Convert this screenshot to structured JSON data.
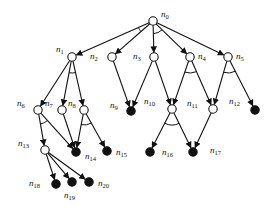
{
  "diagram": {
    "type": "and-or-tree",
    "colors": {
      "stroke": "#111111",
      "background": "#ffffff",
      "terminal_fill": "#111111"
    },
    "nodes": [
      {
        "id": "n0",
        "label": "n",
        "sub": "0",
        "x": 153,
        "y": 21,
        "filled": false,
        "lx": 161,
        "ly": 17,
        "lanchor": "start"
      },
      {
        "id": "n1",
        "label": "n",
        "sub": "1",
        "x": 72,
        "y": 57,
        "filled": false,
        "lx": 56,
        "ly": 52,
        "lanchor": "end"
      },
      {
        "id": "n2",
        "label": "n",
        "sub": "2",
        "x": 112,
        "y": 57,
        "filled": false,
        "lx": 90,
        "ly": 59,
        "lanchor": "start"
      },
      {
        "id": "n3",
        "label": "n",
        "sub": "3",
        "x": 154,
        "y": 57,
        "filled": false,
        "lx": 133,
        "ly": 59,
        "lanchor": "start"
      },
      {
        "id": "n4",
        "label": "n",
        "sub": "4",
        "x": 190,
        "y": 57,
        "filled": false,
        "lx": 198,
        "ly": 59,
        "lanchor": "start"
      },
      {
        "id": "n5",
        "label": "n",
        "sub": "5",
        "x": 228,
        "y": 57,
        "filled": false,
        "lx": 236,
        "ly": 59,
        "lanchor": "start"
      },
      {
        "id": "n6",
        "label": "n",
        "sub": "6",
        "x": 38,
        "y": 110,
        "filled": false,
        "lx": 17,
        "ly": 106,
        "lanchor": "start"
      },
      {
        "id": "n7",
        "label": "n",
        "sub": "7",
        "x": 62,
        "y": 110,
        "filled": false,
        "lx": 45,
        "ly": 106,
        "lanchor": "start"
      },
      {
        "id": "n8",
        "label": "n",
        "sub": "8",
        "x": 84,
        "y": 110,
        "filled": false,
        "lx": 68,
        "ly": 106,
        "lanchor": "start"
      },
      {
        "id": "n9",
        "label": "n",
        "sub": "9",
        "x": 131,
        "y": 111,
        "filled": true,
        "lx": 110,
        "ly": 108,
        "lanchor": "start"
      },
      {
        "id": "n10",
        "label": "n",
        "sub": "10",
        "x": 172,
        "y": 109,
        "filled": false,
        "lx": 144,
        "ly": 104,
        "lanchor": "start"
      },
      {
        "id": "n11",
        "label": "n",
        "sub": "11",
        "x": 213,
        "y": 109,
        "filled": false,
        "lx": 187,
        "ly": 106,
        "lanchor": "start"
      },
      {
        "id": "n12",
        "label": "n",
        "sub": "12",
        "x": 255,
        "y": 110,
        "filled": true,
        "lx": 229,
        "ly": 104,
        "lanchor": "start"
      },
      {
        "id": "n13",
        "label": "n",
        "sub": "13",
        "x": 45,
        "y": 150,
        "filled": false,
        "lx": 18,
        "ly": 146,
        "lanchor": "start"
      },
      {
        "id": "n14",
        "label": "n",
        "sub": "14",
        "x": 76,
        "y": 152,
        "filled": true,
        "lx": 85,
        "ly": 159,
        "lanchor": "start"
      },
      {
        "id": "n15",
        "label": "n",
        "sub": "15",
        "x": 107,
        "y": 151,
        "filled": true,
        "lx": 116,
        "ly": 155,
        "lanchor": "start"
      },
      {
        "id": "n16",
        "label": "n",
        "sub": "16",
        "x": 150,
        "y": 152,
        "filled": true,
        "lx": 162,
        "ly": 155,
        "lanchor": "start"
      },
      {
        "id": "n17",
        "label": "n",
        "sub": "17",
        "x": 193,
        "y": 152,
        "filled": true,
        "lx": 210,
        "ly": 153,
        "lanchor": "start"
      },
      {
        "id": "n18",
        "label": "n",
        "sub": "18",
        "x": 56,
        "y": 184,
        "filled": true,
        "lx": 29,
        "ly": 186,
        "lanchor": "start"
      },
      {
        "id": "n19",
        "label": "n",
        "sub": "19",
        "x": 72,
        "y": 182,
        "filled": true,
        "lx": 64,
        "ly": 198,
        "lanchor": "start"
      },
      {
        "id": "n20",
        "label": "n",
        "sub": "20",
        "x": 89,
        "y": 182,
        "filled": true,
        "lx": 98,
        "ly": 186,
        "lanchor": "start"
      }
    ],
    "edges": [
      {
        "from": "n0",
        "to": "n1"
      },
      {
        "from": "n0",
        "to": "n2"
      },
      {
        "from": "n0",
        "to": "n3"
      },
      {
        "from": "n0",
        "to": "n4"
      },
      {
        "from": "n0",
        "to": "n5"
      },
      {
        "from": "n1",
        "to": "n6"
      },
      {
        "from": "n1",
        "to": "n7"
      },
      {
        "from": "n1",
        "to": "n8"
      },
      {
        "from": "n2",
        "to": "n9"
      },
      {
        "from": "n3",
        "to": "n9"
      },
      {
        "from": "n3",
        "to": "n10"
      },
      {
        "from": "n4",
        "to": "n10"
      },
      {
        "from": "n4",
        "to": "n11"
      },
      {
        "from": "n5",
        "to": "n11"
      },
      {
        "from": "n5",
        "to": "n12"
      },
      {
        "from": "n6",
        "to": "n13"
      },
      {
        "from": "n6",
        "to": "n14"
      },
      {
        "from": "n7",
        "to": "n14"
      },
      {
        "from": "n8",
        "to": "n14"
      },
      {
        "from": "n8",
        "to": "n15"
      },
      {
        "from": "n10",
        "to": "n16"
      },
      {
        "from": "n10",
        "to": "n17"
      },
      {
        "from": "n11",
        "to": "n17"
      },
      {
        "from": "n13",
        "to": "n18"
      },
      {
        "from": "n13",
        "to": "n19"
      },
      {
        "from": "n13",
        "to": "n20"
      }
    ],
    "and_arcs": [
      {
        "node": "n0",
        "edges": [
          "n1",
          "n2"
        ]
      },
      {
        "node": "n0",
        "edges": [
          "n3",
          "n4"
        ]
      },
      {
        "node": "n1",
        "edges": [
          "n7",
          "n8"
        ]
      },
      {
        "node": "n4",
        "edges": [
          "n10",
          "n11"
        ]
      },
      {
        "node": "n5",
        "edges": [
          "n11",
          "n12"
        ]
      },
      {
        "node": "n6",
        "edges": [
          "n13",
          "n14"
        ]
      },
      {
        "node": "n8",
        "edges": [
          "n14",
          "n15"
        ]
      },
      {
        "node": "n10",
        "edges": [
          "n16",
          "n17"
        ]
      }
    ]
  }
}
